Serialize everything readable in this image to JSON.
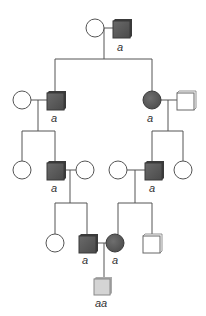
{
  "colors": {
    "line": "#555555",
    "affected": "#5a5a5a",
    "affected_dark_edge": "#3a3a3a",
    "unaffected": "#ffffff",
    "proband": "#d4d4d4"
  },
  "generations": [
    {
      "id": "I",
      "individuals": [
        {
          "id": "I-1",
          "sex": "female",
          "status": "unaffected",
          "genotype": ""
        },
        {
          "id": "I-2",
          "sex": "male",
          "status": "carrier",
          "genotype": "a"
        }
      ]
    },
    {
      "id": "II",
      "individuals": [
        {
          "id": "II-1",
          "sex": "female",
          "status": "unaffected",
          "genotype": ""
        },
        {
          "id": "II-2",
          "sex": "male",
          "status": "carrier",
          "genotype": "a"
        },
        {
          "id": "II-3",
          "sex": "female",
          "status": "carrier",
          "genotype": "a"
        },
        {
          "id": "II-4",
          "sex": "male",
          "status": "unaffected",
          "genotype": ""
        }
      ]
    },
    {
      "id": "III",
      "individuals": [
        {
          "id": "III-1",
          "sex": "female",
          "status": "unaffected",
          "genotype": ""
        },
        {
          "id": "III-2",
          "sex": "male",
          "status": "carrier",
          "genotype": "a"
        },
        {
          "id": "III-3",
          "sex": "female",
          "status": "unaffected",
          "genotype": ""
        },
        {
          "id": "III-4",
          "sex": "female",
          "status": "unaffected",
          "genotype": ""
        },
        {
          "id": "III-5",
          "sex": "male",
          "status": "carrier",
          "genotype": "a"
        },
        {
          "id": "III-6",
          "sex": "female",
          "status": "unaffected",
          "genotype": ""
        }
      ]
    },
    {
      "id": "IV",
      "individuals": [
        {
          "id": "IV-1",
          "sex": "female",
          "status": "unaffected",
          "genotype": ""
        },
        {
          "id": "IV-2",
          "sex": "male",
          "status": "carrier",
          "genotype": "a"
        },
        {
          "id": "IV-3",
          "sex": "female",
          "status": "carrier",
          "genotype": "a"
        },
        {
          "id": "IV-4",
          "sex": "male",
          "status": "unaffected",
          "genotype": ""
        }
      ]
    },
    {
      "id": "V",
      "individuals": [
        {
          "id": "V-1",
          "sex": "male",
          "status": "affected-homozygous",
          "genotype": "aa"
        }
      ]
    }
  ],
  "labels": {
    "I2": "a",
    "II2": "a",
    "II3": "a",
    "III2": "a",
    "III5": "a",
    "IV2": "a",
    "IV3": "a",
    "V1": "aa"
  }
}
